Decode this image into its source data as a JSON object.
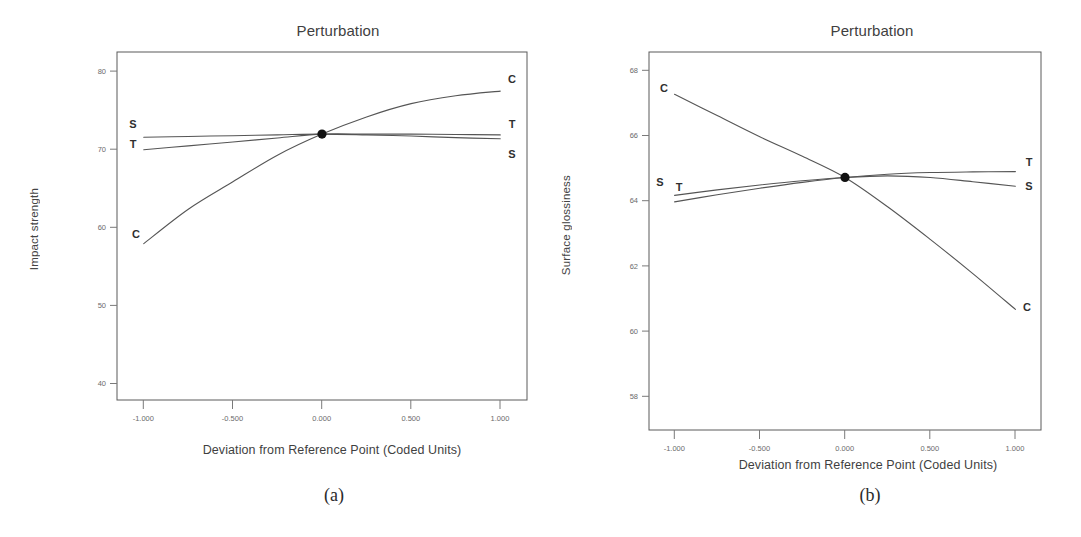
{
  "figure": {
    "panels": [
      {
        "id": "a",
        "caption": "(a)",
        "title": "Perturbation",
        "xlabel": "Deviation from Reference Point (Coded Units)",
        "ylabel": "Impact strength"
      },
      {
        "id": "b",
        "caption": "(b)",
        "title": "Perturbation",
        "xlabel": "Deviation from Reference Point (Coded Units)",
        "ylabel": "Surface glossiness"
      }
    ]
  },
  "ticks": {
    "x": [
      "-1.000",
      "-0.500",
      "0.000",
      "0.500",
      "1.000"
    ],
    "y_a": [
      "40",
      "50",
      "60",
      "70",
      "80"
    ],
    "y_b": [
      "58",
      "60",
      "62",
      "64",
      "66",
      "68"
    ]
  },
  "labels": {
    "a_left": {
      "S": "S",
      "T": "T",
      "C": "C"
    },
    "a_right": {
      "C": "C",
      "T": "T",
      "S": "S"
    },
    "b_left": {
      "C": "C",
      "S": "S",
      "T": "T"
    },
    "b_right": {
      "T": "T",
      "S": "S",
      "C": "C"
    }
  },
  "colors": {
    "curve": "#555555",
    "frame": "#5a5a5a",
    "tick_text": "#6b6b6b",
    "title_text": "#3f3f3f",
    "center_point": "#111111",
    "background": "#ffffff"
  },
  "chart_data": [
    {
      "type": "line",
      "title": "Perturbation",
      "xlabel": "Deviation from Reference Point (Coded Units)",
      "ylabel": "Impact strength",
      "grid": false,
      "legend": "inline-end-labels",
      "xlim": [
        -1.15,
        1.15
      ],
      "ylim": [
        38.0,
        82.5
      ],
      "xticks": [
        -1.0,
        -0.5,
        0.0,
        0.5,
        1.0
      ],
      "yticks": [
        40,
        50,
        60,
        70,
        80
      ],
      "reference_point": {
        "x": 0.0,
        "y": 72.0
      },
      "x": [
        -1.0,
        -0.75,
        -0.5,
        -0.25,
        0.0,
        0.25,
        0.5,
        0.75,
        1.0
      ],
      "series": [
        {
          "name": "C",
          "values": [
            58.0,
            62.4,
            65.9,
            69.3,
            72.0,
            74.2,
            75.9,
            76.9,
            77.5
          ]
        },
        {
          "name": "S",
          "values": [
            71.6,
            71.7,
            71.8,
            71.9,
            72.0,
            71.9,
            71.75,
            71.55,
            71.4
          ]
        },
        {
          "name": "T",
          "values": [
            70.0,
            70.5,
            71.0,
            71.5,
            72.0,
            72.0,
            72.0,
            71.95,
            71.9
          ]
        }
      ]
    },
    {
      "type": "line",
      "title": "Perturbation",
      "xlabel": "Deviation from Reference Point (Coded Units)",
      "ylabel": "Surface glossiness",
      "grid": false,
      "legend": "inline-end-labels",
      "xlim": [
        -1.15,
        1.15
      ],
      "ylim": [
        57.0,
        68.6
      ],
      "xticks": [
        -1.0,
        -0.5,
        0.0,
        0.5,
        1.0
      ],
      "yticks": [
        58,
        60,
        62,
        64,
        66,
        68
      ],
      "reference_point": {
        "x": 0.0,
        "y": 64.75
      },
      "x": [
        -1.0,
        -0.75,
        -0.5,
        -0.25,
        0.0,
        0.25,
        0.5,
        0.75,
        1.0
      ],
      "series": [
        {
          "name": "C",
          "values": [
            67.3,
            66.65,
            66.0,
            65.4,
            64.75,
            63.85,
            62.85,
            61.8,
            60.7
          ]
        },
        {
          "name": "S",
          "values": [
            64.2,
            64.37,
            64.52,
            64.65,
            64.75,
            64.8,
            64.75,
            64.62,
            64.48
          ]
        },
        {
          "name": "T",
          "values": [
            64.0,
            64.22,
            64.42,
            64.6,
            64.75,
            64.85,
            64.9,
            64.92,
            64.93
          ]
        }
      ]
    }
  ]
}
